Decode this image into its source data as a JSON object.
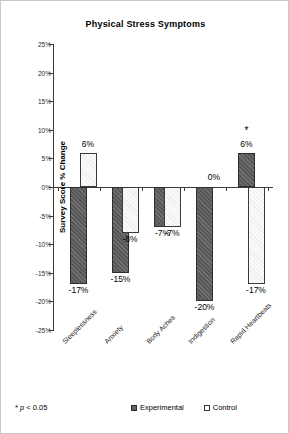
{
  "chart_data": {
    "type": "bar",
    "title": "Physical Stress Symptoms",
    "xlabel": "",
    "ylabel": "Survey Score % Change",
    "ylim": [
      -25,
      25
    ],
    "ytick_values": [
      25,
      20,
      15,
      10,
      5,
      0,
      -5,
      -10,
      -15,
      -20,
      -25
    ],
    "ytick_labels": [
      "25%",
      "20%",
      "15%",
      "10%",
      "5%",
      "0%",
      "-5%",
      "-10%",
      "-15%",
      "-20%",
      "-25%"
    ],
    "grid": false,
    "legend_position": "bottom",
    "categories": [
      "Sleeplessness",
      "Anxiety",
      "Body Aches",
      "Indigestion",
      "Rapid Heartbeats"
    ],
    "series": [
      {
        "name": "Experimental",
        "color": "#58585a",
        "values": [
          -17,
          -15,
          -7,
          -20,
          6
        ],
        "data_labels": [
          "-17%",
          "-15%",
          "-7%",
          "-20%",
          "6%"
        ],
        "significance": [
          "",
          "",
          "",
          "",
          "*"
        ]
      },
      {
        "name": "Control",
        "color": "#fafafa",
        "values": [
          6,
          -8,
          -7,
          0,
          -17
        ],
        "data_labels": [
          "6%",
          "-8%",
          "-7%",
          "0%",
          "-17%"
        ],
        "significance": [
          "",
          "",
          "",
          "",
          ""
        ]
      }
    ],
    "annotations": [
      {
        "text": "*",
        "category": "Rapid Heartbeats",
        "series": "Experimental"
      }
    ],
    "footnote": "* p < 0.05",
    "footnote_symbol": "*",
    "footnote_stat": "p",
    "footnote_rest": " < 0.05"
  },
  "legend": {
    "items": [
      {
        "label": "Experimental"
      },
      {
        "label": "Control"
      }
    ]
  }
}
